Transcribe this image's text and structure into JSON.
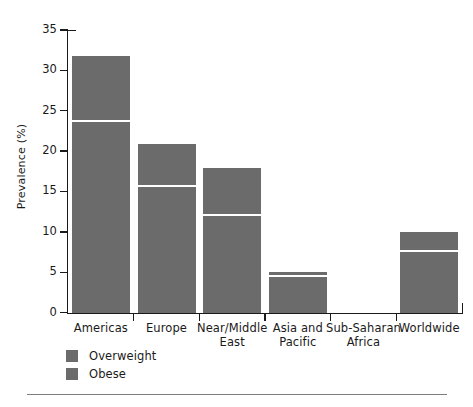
{
  "chart_data": {
    "type": "bar",
    "subtype": "stacked-bar",
    "title": "",
    "xlabel": "",
    "ylabel": "Prevalence (%)",
    "ylim": [
      0,
      35
    ],
    "ytick_step": 5,
    "yticks": [
      "35",
      "30",
      "25",
      "20",
      "15",
      "10",
      "5",
      "0"
    ],
    "ytick_values": [
      35,
      30,
      25,
      20,
      15,
      10,
      5,
      0
    ],
    "grid": false,
    "legend_position": "below-axis-left",
    "categories": [
      "Americas",
      "Europe",
      "Near/Middle East",
      "Asia and Pacific",
      "Sub-Saharan Africa",
      "Worldwide"
    ],
    "series": [
      {
        "name": "Obese",
        "color": "#6b6b6b",
        "values": [
          23.7,
          15.6,
          12.0,
          4.4,
          0.0,
          7.6
        ]
      },
      {
        "name": "Overweight",
        "color": "#6b6b6b",
        "values": [
          8.1,
          5.3,
          6.0,
          0.7,
          0.0,
          2.4
        ]
      }
    ],
    "totals": [
      31.8,
      20.9,
      18.0,
      5.1,
      0.0,
      10.0
    ]
  },
  "axis": {
    "y_title": "Prevalence (%)",
    "ticks": [
      {
        "label": "35",
        "value": 35
      },
      {
        "label": "30",
        "value": 30
      },
      {
        "label": "25",
        "value": 25
      },
      {
        "label": "20",
        "value": 20
      },
      {
        "label": "15",
        "value": 15
      },
      {
        "label": "10",
        "value": 10
      },
      {
        "label": "5",
        "value": 5
      },
      {
        "label": "0",
        "value": 0
      }
    ]
  },
  "categories": [
    {
      "line1": "Americas",
      "line2": ""
    },
    {
      "line1": "Europe",
      "line2": ""
    },
    {
      "line1": "Near/Middle",
      "line2": "East"
    },
    {
      "line1": "Asia and",
      "line2": "Pacific"
    },
    {
      "line1": "Sub-Saharan",
      "line2": "Africa"
    },
    {
      "line1": "Worldwide",
      "line2": ""
    }
  ],
  "legend": {
    "items": [
      {
        "label": "Overweight",
        "color": "#6b6b6b"
      },
      {
        "label": "Obese",
        "color": "#6b6b6b"
      }
    ]
  },
  "colors": {
    "bar": "#6b6b6b",
    "axis": "#1a1a1a",
    "divider": "#ffffff",
    "rule": "#7d7d7d",
    "background": "#ffffff"
  }
}
